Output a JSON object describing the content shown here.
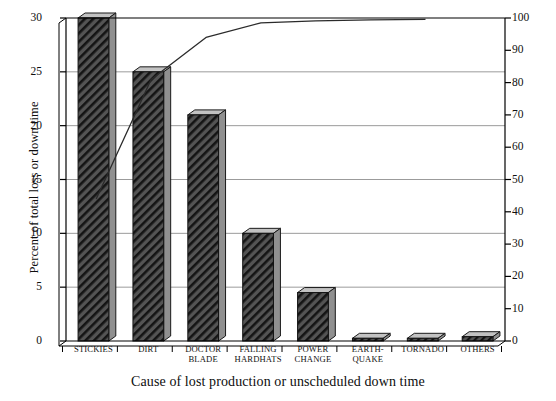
{
  "chart_data": {
    "type": "bar",
    "title": "",
    "xlabel": "Cause of lost production or unscheduled down time",
    "ylabel": "Percent of total loss or down time",
    "y2label": "Cummulative percent of down time",
    "categories": [
      "STICKIES",
      "DIRT",
      "DOCTOR\nBLADE",
      "FALLING\nHARDHATS",
      "POWER\nCHANGE",
      "EARTH-\nQUAKE",
      "TORNADO",
      "OTHERS"
    ],
    "values": [
      30.0,
      25.0,
      21.0,
      10.0,
      4.5,
      0.25,
      0.25,
      0.4
    ],
    "series": [
      {
        "name": "Percent of total loss or down time",
        "type": "bar",
        "values": [
          30.0,
          25.0,
          21.0,
          10.0,
          4.5,
          0.25,
          0.25,
          0.4
        ]
      },
      {
        "name": "Cummulative percent of down time",
        "type": "line",
        "values": [
          44.0,
          80.6,
          111.4,
          126.0,
          132.6,
          133.0,
          133.4,
          134.0
        ]
      }
    ],
    "cumulative_percent": [
      44.0,
      80.6,
      111.4,
      126.0,
      132.6,
      133.0,
      133.4,
      134.0
    ],
    "cumulative_drawn": [
      44,
      81,
      94,
      98.5,
      99.1,
      99.4,
      99.6,
      99.6
    ],
    "ylim": [
      0,
      30
    ],
    "y2lim": [
      0,
      100
    ],
    "yticks": [
      "0",
      "5",
      "10",
      "15",
      "20",
      "25",
      "30"
    ],
    "ytick_values": [
      0,
      5,
      10,
      15,
      20,
      25,
      30
    ],
    "y2ticks": [
      "0",
      "10",
      "20",
      "30",
      "40",
      "50",
      "60",
      "70",
      "80",
      "90",
      "100"
    ],
    "y2tick_values": [
      0,
      10,
      20,
      30,
      40,
      50,
      60,
      70,
      80,
      90,
      100
    ],
    "grid": true,
    "gridlines_at": [
      5,
      10,
      15,
      20,
      25
    ],
    "legend": "none",
    "bar_style": "hatched-diagonal-3d",
    "colors": {
      "bar_fill": "#4a4a4a",
      "bar_hatch": "#1a1a1a",
      "bar_top": "#b8b8b8",
      "bar_side": "#8a8a8a",
      "line": "#2b2b2b",
      "axis": "#000000",
      "grid": "#9b9b9b",
      "background": "#ffffff"
    }
  },
  "axes": {
    "left_title": "Percent of total loss or down time",
    "right_title": "Cummulative percent of down time",
    "bottom_title": "Cause of lost production or unscheduled down time"
  }
}
